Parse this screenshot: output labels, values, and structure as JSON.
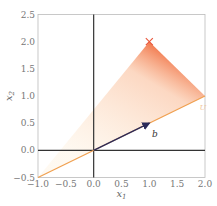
{
  "chart_data": {
    "type": "line",
    "title": "",
    "xlabel": "x_1",
    "ylabel": "x_2",
    "xlim": [
      -1.0,
      2.0
    ],
    "ylim": [
      -0.5,
      2.5
    ],
    "xticks": [
      "−1.0",
      "−0.5",
      "0.0",
      "0.5",
      "1.0",
      "1.5",
      "2.0"
    ],
    "yticks": [
      "−0.5",
      "0.0",
      "0.5",
      "1.0",
      "1.5",
      "2.0",
      "2.5"
    ],
    "grid": false,
    "series": [
      {
        "name": "U",
        "kind": "line",
        "color": "#f0a050",
        "x": [
          -1.0,
          2.0
        ],
        "y": [
          -0.5,
          1.0
        ]
      },
      {
        "name": "b",
        "kind": "arrow",
        "color": "#2a2a5a",
        "from": [
          0,
          0
        ],
        "to": [
          1.0,
          0.5
        ]
      },
      {
        "name": "target",
        "kind": "marker",
        "marker": "x",
        "color": "#e8553a",
        "x": [
          1.0
        ],
        "y": [
          2.0
        ]
      },
      {
        "name": "projection-fan",
        "kind": "shaded-region",
        "color": "#f4a070",
        "vertices": [
          [
            1.0,
            2.0
          ],
          [
            -1.0,
            -0.5
          ],
          [
            2.0,
            1.0
          ]
        ]
      }
    ],
    "annotations": [
      {
        "text": "b",
        "x": 1.05,
        "y": 0.3
      },
      {
        "text": "U",
        "x": 1.9,
        "y": 0.8
      }
    ],
    "axes_lines": {
      "x0": 0.0,
      "y0": 0.0
    }
  }
}
